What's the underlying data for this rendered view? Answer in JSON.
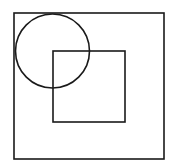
{
  "diagram": {
    "background": "#ffffff",
    "stroke_color": "#1a1a1a",
    "shapes": [
      {
        "type": "square",
        "name": "outer-square",
        "x": 14,
        "y": 13,
        "width": 150,
        "height": 146
      },
      {
        "type": "square",
        "name": "inner-square",
        "x": 53,
        "y": 51,
        "width": 72,
        "height": 71
      },
      {
        "type": "circle",
        "name": "circle",
        "cx": 52.5,
        "cy": 51,
        "r": 37
      }
    ]
  }
}
